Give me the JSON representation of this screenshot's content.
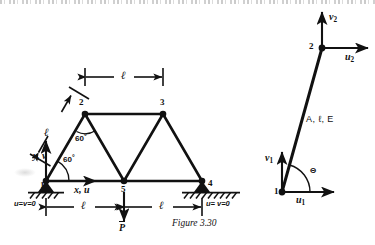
{
  "figure": {
    "caption": "Figure 3.30"
  },
  "truss": {
    "nodes": [
      {
        "id": "1",
        "x": 46,
        "y": 181,
        "label": "1"
      },
      {
        "id": "2",
        "x": 85,
        "y": 114,
        "label": "2"
      },
      {
        "id": "3",
        "x": 163,
        "y": 114,
        "label": "3"
      },
      {
        "id": "4",
        "x": 202,
        "y": 181,
        "label": "4"
      },
      {
        "id": "5",
        "x": 124,
        "y": 181,
        "label": "5"
      }
    ],
    "members": [
      {
        "from": "1",
        "to": "2"
      },
      {
        "from": "2",
        "to": "3"
      },
      {
        "from": "2",
        "to": "5"
      },
      {
        "from": "3",
        "to": "5"
      },
      {
        "from": "3",
        "to": "4"
      },
      {
        "from": "1",
        "to": "5"
      },
      {
        "from": "5",
        "to": "4"
      }
    ],
    "angles": [
      {
        "name": "angle-at-node-1",
        "value": "60",
        "unit": "°"
      },
      {
        "name": "angle-at-node-2",
        "value": "60",
        "unit": "°"
      }
    ],
    "dimensions": [
      {
        "name": "top-span-2-3",
        "label": "ℓ"
      },
      {
        "name": "diagonal-1-2",
        "label": "ℓ"
      },
      {
        "name": "bottom-span-1-5",
        "label": "ℓ"
      },
      {
        "name": "bottom-span-5-4",
        "label": "ℓ"
      }
    ],
    "axes": {
      "x_label": "x, u",
      "y_label": "y, v"
    },
    "load": {
      "symbol": "P",
      "overbar": true,
      "at_node": "5",
      "direction": "down"
    },
    "supports": [
      {
        "at_node": "1",
        "condition": "u=v=0",
        "type": "pinned-hatched"
      },
      {
        "at_node": "4",
        "condition": "u= v=0",
        "type": "pinned-hatched"
      }
    ]
  },
  "element": {
    "node_start": "1",
    "node_end": "2",
    "properties": "A, ℓ, E",
    "properties_parts": {
      "area": "A",
      "length": "ℓ",
      "modulus": "E"
    },
    "angle_symbol": "Θ",
    "dofs": [
      {
        "name": "u1",
        "base": "u",
        "sub": "1",
        "direction": "right",
        "at_node": "1"
      },
      {
        "name": "v1",
        "base": "v",
        "sub": "1",
        "direction": "up",
        "at_node": "1"
      },
      {
        "name": "u2",
        "base": "u",
        "sub": "2",
        "direction": "right",
        "at_node": "2"
      },
      {
        "name": "v2",
        "base": "v",
        "sub": "2",
        "direction": "up",
        "at_node": "2"
      }
    ]
  },
  "colors": {
    "ink": "#111111",
    "paper": "#ffffff"
  }
}
